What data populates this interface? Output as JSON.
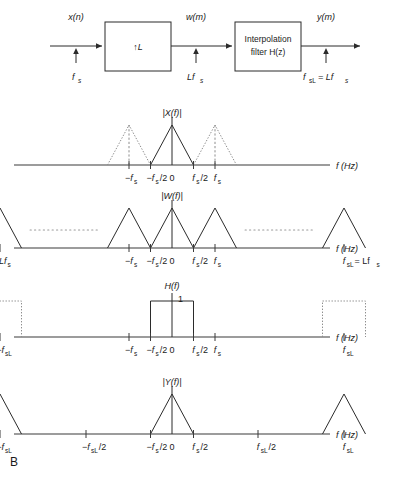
{
  "figure": {
    "panel_label": "B",
    "axis_label": "f (Hz)"
  },
  "block_diagram": {
    "input_signal": "x(n)",
    "mid_signal": "w(m)",
    "output_signal": "y(m)",
    "upsampler_label": "↑L",
    "filter_label_line1": "Interpolation",
    "filter_label_line2": "filter H(z)",
    "rate_input": "f",
    "rate_input_sub": "s",
    "rate_mid": "Lf",
    "rate_mid_sub": "s",
    "rate_output": "f",
    "rate_output_sub": "sL",
    "rate_output_rest": " = Lf",
    "rate_output_rest_sub": "s"
  },
  "plots": [
    {
      "id": "plot-x",
      "title": "|X(f)|",
      "axis_label": "f (Hz)",
      "ticks": [
        {
          "label": "−f",
          "sub": "s",
          "x": -1.0
        },
        {
          "label": "−f",
          "sub": "s",
          "suffix": "/2",
          "x": -0.5
        },
        {
          "label": "0",
          "sub": "",
          "x": 0.0
        },
        {
          "label": "f",
          "sub": "s",
          "suffix": "/2",
          "x": 0.5
        },
        {
          "label": "f",
          "sub": "s",
          "x": 1.0
        }
      ],
      "triangles": [
        {
          "center": -1.0,
          "half_width": 0.5,
          "style": "dotted"
        },
        {
          "center": 0.0,
          "half_width": 0.5,
          "style": "solid"
        },
        {
          "center": 1.0,
          "half_width": 0.5,
          "style": "dotted"
        }
      ]
    },
    {
      "id": "plot-w",
      "title": "|W(f)|",
      "axis_label": "f (Hz)",
      "ticks": [
        {
          "label": "−Lf",
          "sub": "s",
          "x": -4.0
        },
        {
          "label": "−f",
          "sub": "s",
          "x": -1.0
        },
        {
          "label": "−f",
          "sub": "s",
          "suffix": "/2",
          "x": -0.5
        },
        {
          "label": "0",
          "sub": "",
          "x": 0.0
        },
        {
          "label": "f",
          "sub": "s",
          "suffix": "/2",
          "x": 0.5
        },
        {
          "label": "f",
          "sub": "s",
          "x": 1.0
        },
        {
          "label": "f",
          "sub": "sL",
          "suffix": " = Lf",
          "suffix_sub": "s",
          "x": 4.0
        }
      ],
      "triangles": [
        {
          "center": -4.0,
          "half_width": 0.5,
          "style": "solid"
        },
        {
          "center": -1.0,
          "half_width": 0.5,
          "style": "solid"
        },
        {
          "center": 0.0,
          "half_width": 0.5,
          "style": "solid"
        },
        {
          "center": 1.0,
          "half_width": 0.5,
          "style": "solid"
        },
        {
          "center": 4.0,
          "half_width": 0.5,
          "style": "solid"
        }
      ],
      "ellipses": [
        {
          "from": -3.3,
          "to": -1.7
        },
        {
          "from": 1.7,
          "to": 3.3
        }
      ]
    },
    {
      "id": "plot-h",
      "title": "H(f)",
      "gain_label": "1",
      "axis_label": "f (Hz)",
      "ticks": [
        {
          "label": "−f",
          "sub": "sL",
          "x": -4.0
        },
        {
          "label": "−f",
          "sub": "s",
          "x": -1.0
        },
        {
          "label": "−f",
          "sub": "s",
          "suffix": "/2",
          "x": -0.5
        },
        {
          "label": "0",
          "sub": "",
          "x": 0.0
        },
        {
          "label": "f",
          "sub": "s",
          "suffix": "/2",
          "x": 0.5
        },
        {
          "label": "f",
          "sub": "s",
          "x": 1.0
        },
        {
          "label": "f",
          "sub": "sL",
          "x": 4.0
        }
      ],
      "rects": [
        {
          "center": -4.0,
          "half_width": 0.5,
          "style": "dotted"
        },
        {
          "center": 0.0,
          "half_width": 0.5,
          "style": "solid"
        },
        {
          "center": 4.0,
          "half_width": 0.5,
          "style": "dotted"
        }
      ]
    },
    {
      "id": "plot-y",
      "title": "|Y(f)|",
      "axis_label": "f (Hz)",
      "ticks": [
        {
          "label": "−f",
          "sub": "sL",
          "x": -4.0
        },
        {
          "label": "−f",
          "sub": "sL",
          "suffix": "/2",
          "x": -2.0
        },
        {
          "label": "−f",
          "sub": "s",
          "suffix": "/2",
          "x": -0.5
        },
        {
          "label": "0",
          "sub": "",
          "x": 0.0
        },
        {
          "label": "f",
          "sub": "s",
          "suffix": "/2",
          "x": 0.5
        },
        {
          "label": "f",
          "sub": "sL",
          "suffix": "/2",
          "x": 2.0
        },
        {
          "label": "f",
          "sub": "sL",
          "x": 4.0
        }
      ],
      "triangles": [
        {
          "center": -4.0,
          "half_width": 0.5,
          "style": "solid"
        },
        {
          "center": 0.0,
          "half_width": 0.5,
          "style": "solid"
        },
        {
          "center": 4.0,
          "half_width": 0.5,
          "style": "solid"
        }
      ]
    }
  ]
}
